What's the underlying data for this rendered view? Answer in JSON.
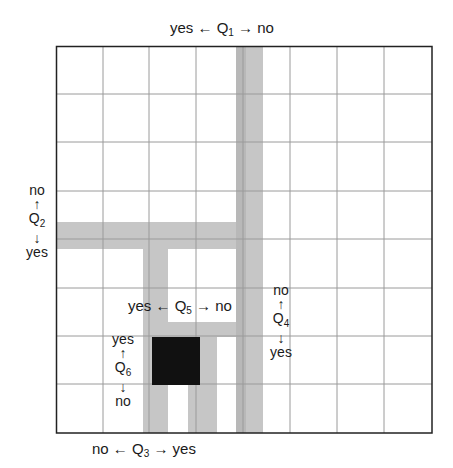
{
  "diagram": {
    "type": "binary-search-grid",
    "grid": {
      "columns": 8,
      "rows": 8,
      "background": "#ffffff",
      "line_color": "#9a9a9a",
      "border_color": "#222222"
    },
    "colors": {
      "band": "#c4c4c4",
      "band_dark": "#b4b4b4",
      "target": "#111111"
    },
    "questions": {
      "q1": {
        "label": "Q",
        "sub": "1",
        "left": "yes",
        "right": "no",
        "orientation": "horizontal"
      },
      "q2": {
        "label": "Q",
        "sub": "2",
        "up": "no",
        "down": "yes",
        "orientation": "vertical"
      },
      "q3": {
        "label": "Q",
        "sub": "3",
        "left": "no",
        "right": "yes",
        "orientation": "horizontal"
      },
      "q4": {
        "label": "Q",
        "sub": "4",
        "up": "no",
        "down": "yes",
        "orientation": "vertical"
      },
      "q5": {
        "label": "Q",
        "sub": "5",
        "left": "yes",
        "right": "no",
        "orientation": "horizontal"
      },
      "q6": {
        "label": "Q",
        "sub": "6",
        "up": "yes",
        "down": "no",
        "orientation": "vertical"
      }
    },
    "arrows": {
      "left": "←",
      "right": "→",
      "up": "↑",
      "down": "↓"
    }
  }
}
